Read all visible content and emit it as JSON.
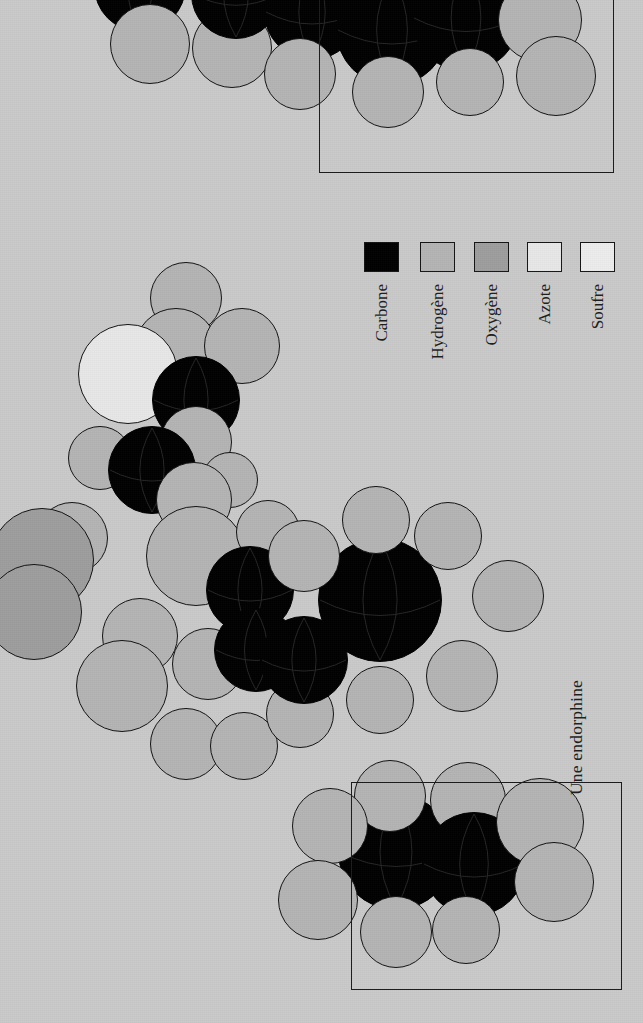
{
  "figure": {
    "caption": "Une endorphine",
    "background_color": "#cacaca",
    "orientation_note": "rotated-90",
    "width": 643,
    "height": 1023
  },
  "legend": {
    "title": "",
    "items": [
      {
        "label": "Carbone",
        "symbol": "C",
        "color": "#000000",
        "swatch": "filled-black"
      },
      {
        "label": "Hydrogène",
        "symbol": "H",
        "color": "#b4b4b4",
        "swatch": "filled-light-gray"
      },
      {
        "label": "Oxygène",
        "symbol": "O",
        "color": "#9e9e9e",
        "swatch": "filled-medium-gray"
      },
      {
        "label": "Azote",
        "symbol": "N",
        "color": "#e8e8e8",
        "swatch": "outline-white"
      },
      {
        "label": "Soufre",
        "symbol": "S",
        "color": "#ededed",
        "swatch": "outline-white"
      }
    ]
  },
  "frames": [
    {
      "name": "top-detail-frame",
      "x": 319,
      "y": -60,
      "w": 293,
      "h": 231
    },
    {
      "name": "bottom-detail-frame",
      "x": 351,
      "y": 782,
      "w": 269,
      "h": 206
    }
  ],
  "molecule": {
    "name": "Une endorphine",
    "representation": "space-filling",
    "atoms": [
      {
        "el": "C",
        "x": 140,
        "y": -14,
        "r": 46
      },
      {
        "el": "H",
        "x": 150,
        "y": 44,
        "r": 40
      },
      {
        "el": "H",
        "x": 232,
        "y": 48,
        "r": 40
      },
      {
        "el": "C",
        "x": 236,
        "y": -6,
        "r": 45
      },
      {
        "el": "C",
        "x": 312,
        "y": 12,
        "r": 48
      },
      {
        "el": "H",
        "x": 300,
        "y": 74,
        "r": 36
      },
      {
        "el": "C",
        "x": 392,
        "y": 30,
        "r": 56
      },
      {
        "el": "C",
        "x": 466,
        "y": 18,
        "r": 54
      },
      {
        "el": "H",
        "x": 388,
        "y": 92,
        "r": 36
      },
      {
        "el": "H",
        "x": 470,
        "y": 82,
        "r": 34
      },
      {
        "el": "H",
        "x": 540,
        "y": 20,
        "r": 42
      },
      {
        "el": "H",
        "x": 556,
        "y": 76,
        "r": 40
      },
      {
        "el": "H",
        "x": 186,
        "y": 298,
        "r": 36
      },
      {
        "el": "H",
        "x": 176,
        "y": 350,
        "r": 42
      },
      {
        "el": "N",
        "x": 128,
        "y": 374,
        "r": 50
      },
      {
        "el": "H",
        "x": 242,
        "y": 346,
        "r": 38
      },
      {
        "el": "C",
        "x": 196,
        "y": 400,
        "r": 44
      },
      {
        "el": "H",
        "x": 196,
        "y": 442,
        "r": 36
      },
      {
        "el": "H",
        "x": 100,
        "y": 458,
        "r": 32
      },
      {
        "el": "H",
        "x": 230,
        "y": 480,
        "r": 28
      },
      {
        "el": "C",
        "x": 152,
        "y": 470,
        "r": 44
      },
      {
        "el": "H",
        "x": 72,
        "y": 538,
        "r": 36
      },
      {
        "el": "O",
        "x": 42,
        "y": 560,
        "r": 52
      },
      {
        "el": "O",
        "x": 34,
        "y": 612,
        "r": 48
      },
      {
        "el": "H",
        "x": 194,
        "y": 500,
        "r": 38
      },
      {
        "el": "H",
        "x": 196,
        "y": 556,
        "r": 50
      },
      {
        "el": "H",
        "x": 268,
        "y": 532,
        "r": 32
      },
      {
        "el": "C",
        "x": 250,
        "y": 590,
        "r": 44
      },
      {
        "el": "H",
        "x": 140,
        "y": 636,
        "r": 38
      },
      {
        "el": "H",
        "x": 122,
        "y": 686,
        "r": 46
      },
      {
        "el": "H",
        "x": 208,
        "y": 664,
        "r": 36
      },
      {
        "el": "C",
        "x": 256,
        "y": 650,
        "r": 42
      },
      {
        "el": "H",
        "x": 186,
        "y": 744,
        "r": 36
      },
      {
        "el": "H",
        "x": 244,
        "y": 746,
        "r": 34
      },
      {
        "el": "H",
        "x": 300,
        "y": 714,
        "r": 34
      },
      {
        "el": "C",
        "x": 304,
        "y": 660,
        "r": 44
      },
      {
        "el": "C",
        "x": 380,
        "y": 600,
        "r": 62
      },
      {
        "el": "H",
        "x": 304,
        "y": 556,
        "r": 36
      },
      {
        "el": "H",
        "x": 376,
        "y": 520,
        "r": 34
      },
      {
        "el": "H",
        "x": 448,
        "y": 536,
        "r": 34
      },
      {
        "el": "H",
        "x": 508,
        "y": 596,
        "r": 36
      },
      {
        "el": "H",
        "x": 462,
        "y": 676,
        "r": 36
      },
      {
        "el": "H",
        "x": 380,
        "y": 700,
        "r": 34
      },
      {
        "el": "C",
        "x": 396,
        "y": 852,
        "r": 58
      },
      {
        "el": "H",
        "x": 390,
        "y": 796,
        "r": 36
      },
      {
        "el": "H",
        "x": 468,
        "y": 800,
        "r": 38
      },
      {
        "el": "C",
        "x": 474,
        "y": 864,
        "r": 52
      },
      {
        "el": "H",
        "x": 540,
        "y": 822,
        "r": 44
      },
      {
        "el": "H",
        "x": 554,
        "y": 882,
        "r": 40
      },
      {
        "el": "H",
        "x": 396,
        "y": 932,
        "r": 36
      },
      {
        "el": "H",
        "x": 466,
        "y": 930,
        "r": 34
      },
      {
        "el": "H",
        "x": 330,
        "y": 826,
        "r": 38
      },
      {
        "el": "H",
        "x": 318,
        "y": 900,
        "r": 40
      }
    ]
  }
}
